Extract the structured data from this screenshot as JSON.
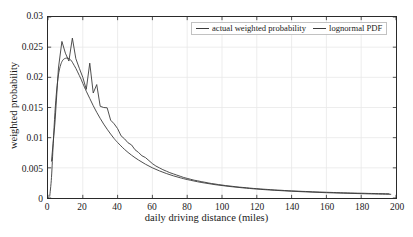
{
  "chart_data": {
    "type": "line",
    "title": "",
    "xlabel": "daily driving distance (miles)",
    "ylabel": "weighted probability",
    "xlim": [
      0,
      200
    ],
    "ylim": [
      0,
      0.03
    ],
    "xticks": [
      0,
      20,
      40,
      60,
      80,
      100,
      120,
      140,
      160,
      180,
      200
    ],
    "xticklabels": [
      "0",
      "20",
      "40",
      "60",
      "80",
      "100",
      "120",
      "140",
      "160",
      "180",
      "200"
    ],
    "yticks": [
      0,
      0.005,
      0.01,
      0.015,
      0.02,
      0.025,
      0.03
    ],
    "yticklabels": [
      "0",
      "0.005",
      "0.01",
      "0.015",
      "0.02",
      "0.025",
      "0.03"
    ],
    "grid": true,
    "grid_color": "#e8e8e8",
    "axis_color": "#2a2a2a",
    "legend_position": "top-center",
    "series": [
      {
        "name": "actual weighted probability",
        "color": "#3b3b3b",
        "linewidth": 0.9,
        "x": [
          2,
          4,
          6,
          8,
          10,
          12,
          14,
          16,
          18,
          20,
          22,
          24,
          26,
          28,
          30,
          32,
          34,
          36,
          38,
          40,
          42,
          44,
          46,
          48,
          50,
          52,
          54,
          56,
          58,
          60,
          62,
          64,
          66,
          68,
          70,
          72,
          74,
          76,
          78,
          80,
          82,
          84,
          86,
          88,
          90,
          92,
          94,
          96,
          98,
          100,
          102,
          104,
          106,
          108,
          110,
          112,
          114,
          116,
          118,
          120,
          122,
          124,
          126,
          128,
          130,
          132,
          134,
          136,
          138,
          140,
          142,
          144,
          146,
          148,
          150,
          152,
          154,
          156,
          158,
          160,
          162,
          164,
          166,
          168,
          170,
          172,
          174,
          176,
          178,
          180,
          182,
          184,
          186,
          188,
          190,
          192,
          194,
          196
        ],
        "y": [
          0.0061,
          0.01245,
          0.02155,
          0.02595,
          0.024,
          0.0227,
          0.0265,
          0.0231,
          0.0215,
          0.02,
          0.018,
          0.02235,
          0.0174,
          0.0188,
          0.0152,
          0.015,
          0.01495,
          0.0129,
          0.0123,
          0.0115,
          0.0103,
          0.0098,
          0.00915,
          0.0088,
          0.008,
          0.00755,
          0.007,
          0.0067,
          0.0062,
          0.0057,
          0.0053,
          0.005,
          0.0047,
          0.00445,
          0.0042,
          0.004,
          0.0038,
          0.0036,
          0.0034,
          0.00325,
          0.0031,
          0.00295,
          0.00285,
          0.00272,
          0.00262,
          0.0025,
          0.0024,
          0.00232,
          0.00222,
          0.00215,
          0.00206,
          0.002,
          0.00193,
          0.00186,
          0.0018,
          0.00175,
          0.0017,
          0.00164,
          0.00159,
          0.00155,
          0.0015,
          0.00146,
          0.00142,
          0.00138,
          0.00134,
          0.00131,
          0.00128,
          0.00124,
          0.00121,
          0.00118,
          0.00116,
          0.00113,
          0.0011,
          0.00108,
          0.00106,
          0.00103,
          0.00101,
          0.00099,
          0.00097,
          0.00095,
          0.00093,
          0.00091,
          0.00089,
          0.00088,
          0.00086,
          0.00085,
          0.00083,
          0.00082,
          0.0008,
          0.00079,
          0.00078,
          0.00076,
          0.00075,
          0.00074,
          0.00073,
          0.00072,
          0.00071,
          0.0007
        ],
        "jagged_overrides": {
          "note": "actual data is noisy; local spikes above the smooth fit",
          "x": [
            22,
            24,
            26,
            28,
            32,
            34,
            42,
            52,
            62,
            92,
            102,
            122,
            152,
            176,
            196
          ],
          "y": [
            0.018,
            0.02235,
            0.0174,
            0.0188,
            0.015,
            0.01495,
            0.0103,
            0.00755,
            0.0053,
            0.0031,
            0.00215,
            0.0015,
            0.00106,
            0.00085,
            0.0007
          ]
        }
      },
      {
        "name": "lognormal PDF",
        "color": "#3b3b3b",
        "linewidth": 0.9,
        "x": [
          1,
          2,
          3,
          4,
          5,
          6,
          7,
          8,
          9,
          10,
          11,
          12,
          13,
          14,
          15,
          16,
          17,
          18,
          19,
          20,
          22,
          24,
          26,
          28,
          30,
          32,
          34,
          36,
          38,
          40,
          44,
          48,
          52,
          56,
          60,
          64,
          68,
          72,
          76,
          80,
          88,
          96,
          104,
          112,
          120,
          130,
          140,
          150,
          160,
          170,
          180,
          190,
          197
        ],
        "y": [
          0.0003,
          0.0034,
          0.009,
          0.0142,
          0.0179,
          0.0204,
          0.0218,
          0.0226,
          0.023,
          0.02315,
          0.0232,
          0.0231,
          0.0229,
          0.0225,
          0.022,
          0.0215,
          0.0209,
          0.0203,
          0.0197,
          0.019,
          0.0177,
          0.0165,
          0.0153,
          0.0142,
          0.0132,
          0.01225,
          0.0114,
          0.0106,
          0.00985,
          0.0092,
          0.00805,
          0.0071,
          0.0063,
          0.0056,
          0.005,
          0.0045,
          0.00406,
          0.00368,
          0.00335,
          0.00306,
          0.00258,
          0.00221,
          0.00192,
          0.00168,
          0.00148,
          0.00128,
          0.00112,
          0.00099,
          0.00088,
          0.00079,
          0.00072,
          0.00065,
          0.00061
        ]
      }
    ]
  },
  "legend": {
    "entries": [
      {
        "label": "actual weighted probability"
      },
      {
        "label": "lognormal PDF"
      }
    ]
  }
}
